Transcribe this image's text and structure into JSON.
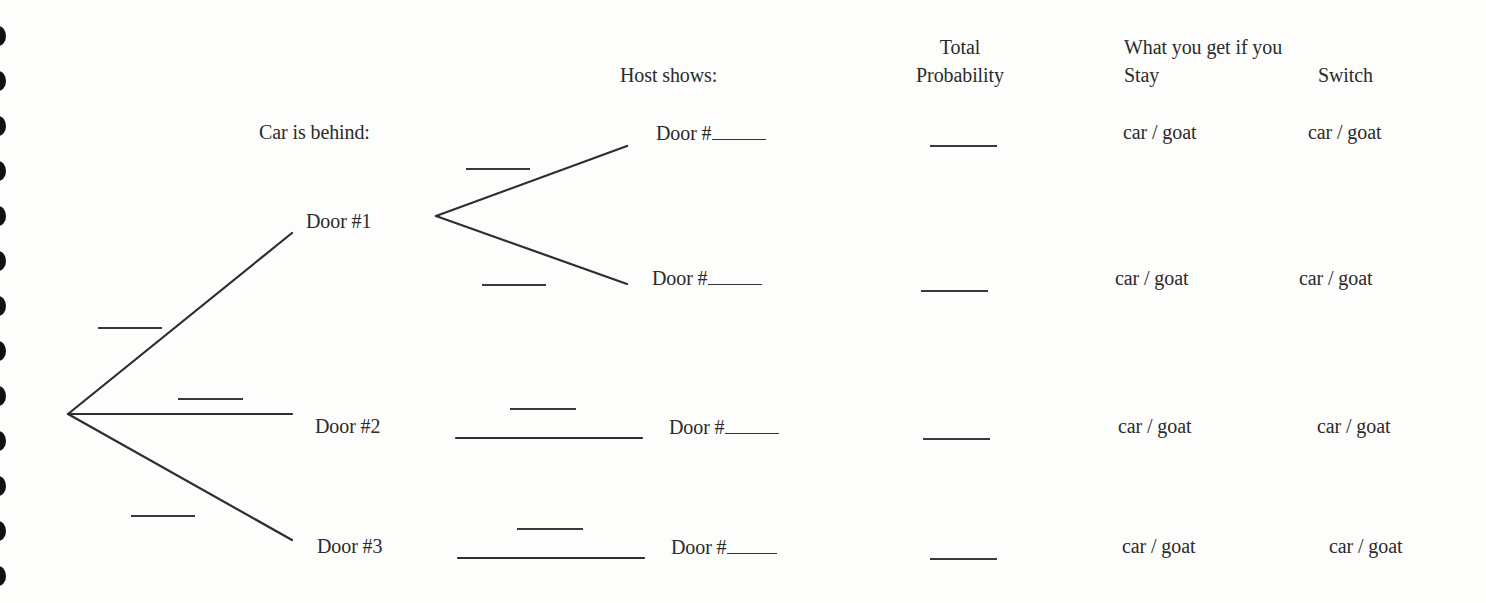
{
  "headers": {
    "car_is_behind": "Car is behind:",
    "host_shows": "Host shows:",
    "total_probability_line1": "Total",
    "total_probability_line2": "Probability",
    "what_you_get": "What you get if you",
    "stay": "Stay",
    "switch": "Switch"
  },
  "first_level": [
    {
      "label": "Door #1"
    },
    {
      "label": "Door #2"
    },
    {
      "label": "Door #3"
    }
  ],
  "host_rows": [
    {
      "label": "Door #",
      "stay": "car / goat",
      "switch": "car / goat"
    },
    {
      "label": "Door #",
      "stay": "car / goat",
      "switch": "car / goat"
    },
    {
      "label": "Door #",
      "stay": "car / goat",
      "switch": "car / goat"
    },
    {
      "label": "Door #",
      "stay": "car / goat",
      "switch": "car / goat"
    }
  ],
  "colors": {
    "background": "#fdfdfc",
    "ink": "#2b2b2b",
    "hole": "#111111"
  },
  "margin_holes": 13
}
